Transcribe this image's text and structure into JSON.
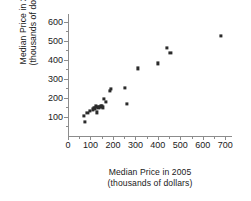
{
  "chart_data": {
    "type": "scatter",
    "title": "",
    "xlabel": "Median Price in 2005",
    "xlabel_sub": "(thousands of dollars)",
    "ylabel": "Median Price in 2008",
    "ylabel_sub": "(thousands of dollars)",
    "xlim": [
      0,
      730
    ],
    "ylim": [
      0,
      640
    ],
    "grid": false,
    "legend": null,
    "marker": "square",
    "marker_color": "#2b2b2b",
    "axis_color": "#8c8c8c",
    "xticks": [
      0,
      100,
      200,
      300,
      400,
      500,
      600,
      700
    ],
    "xtick_labels": [
      "0",
      "100",
      "200",
      "300",
      "400",
      "500",
      "600",
      "700"
    ],
    "x_minor_ticks": [
      50,
      150,
      250,
      350,
      450,
      550,
      650
    ],
    "yticks": [
      100,
      200,
      300,
      400,
      500,
      600
    ],
    "ytick_labels": [
      "100",
      "200",
      "300",
      "400",
      "500",
      "600"
    ],
    "y_minor_ticks": [
      50,
      150,
      250,
      350,
      450,
      550
    ],
    "points": [
      {
        "x": 70,
        "y": 105
      },
      {
        "x": 76,
        "y": 75
      },
      {
        "x": 86,
        "y": 120
      },
      {
        "x": 96,
        "y": 130
      },
      {
        "x": 110,
        "y": 140
      },
      {
        "x": 116,
        "y": 146
      },
      {
        "x": 121,
        "y": 145
      },
      {
        "x": 126,
        "y": 155
      },
      {
        "x": 130,
        "y": 124
      },
      {
        "x": 135,
        "y": 150
      },
      {
        "x": 140,
        "y": 151
      },
      {
        "x": 146,
        "y": 156
      },
      {
        "x": 151,
        "y": 155
      },
      {
        "x": 156,
        "y": 150
      },
      {
        "x": 160,
        "y": 196
      },
      {
        "x": 167,
        "y": 180
      },
      {
        "x": 186,
        "y": 236
      },
      {
        "x": 191,
        "y": 246
      },
      {
        "x": 255,
        "y": 251
      },
      {
        "x": 261,
        "y": 170
      },
      {
        "x": 311,
        "y": 355
      },
      {
        "x": 401,
        "y": 381
      },
      {
        "x": 440,
        "y": 461
      },
      {
        "x": 456,
        "y": 436
      },
      {
        "x": 681,
        "y": 526
      }
    ]
  }
}
